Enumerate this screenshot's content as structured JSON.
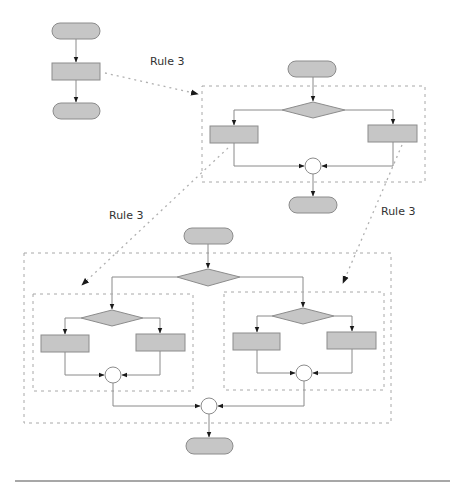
{
  "diagram": {
    "labels": {
      "rule_top": "Rule 3",
      "rule_left": "Rule 3",
      "rule_right": "Rule 3"
    },
    "colors": {
      "shape_fill": "#c6c6c6",
      "shape_stroke": "#8c8c8c",
      "connector_fill": "#ffffff",
      "dashed_box": "#a8a8a8"
    },
    "stages": [
      {
        "name": "original",
        "shapes": [
          "start-terminal",
          "process",
          "end-terminal"
        ]
      },
      {
        "name": "after-first-rule-3",
        "shapes": [
          "start-terminal",
          "decision",
          "process",
          "process",
          "join",
          "end-terminal"
        ]
      },
      {
        "name": "after-second-rule-3",
        "shapes": [
          "start-terminal",
          "decision",
          "decision",
          "process",
          "process",
          "join",
          "decision",
          "process",
          "process",
          "join",
          "join",
          "end-terminal"
        ]
      }
    ]
  }
}
